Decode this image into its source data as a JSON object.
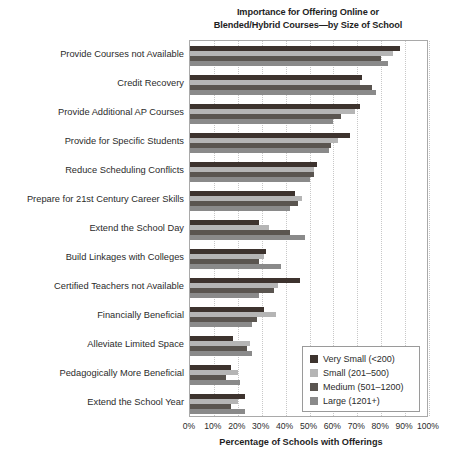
{
  "chart_data": {
    "type": "bar",
    "orientation": "horizontal",
    "title": "Importance for Offering Online or Blended/Hybrid Courses—by Size of School",
    "title_line1": "Importance for Offering Online or",
    "title_line2": "Blended/Hybrid Courses—by Size of School",
    "xlabel": "Percentage of Schools with Offerings",
    "ylabel": "",
    "xlim": [
      0,
      100
    ],
    "xtick_labels": [
      "0%",
      "10%",
      "20%",
      "30%",
      "40%",
      "50%",
      "60%",
      "70%",
      "80%",
      "90%",
      "100%"
    ],
    "xtick_values": [
      0,
      10,
      20,
      30,
      40,
      50,
      60,
      70,
      80,
      90,
      100
    ],
    "grid": true,
    "grid_axis": "x",
    "legend_position": "lower right",
    "categories": [
      "Provide Courses not Available",
      "Credit Recovery",
      "Provide Additional AP Courses",
      "Provide for Specific Students",
      "Reduce Scheduling Conflicts",
      "Prepare for 21st Century Career Skills",
      "Extend the School Day",
      "Build Linkages with Colleges",
      "Certified Teachers not Available",
      "Financially Beneficial",
      "Alleviate Limited Space",
      "Pedagogically More Beneficial",
      "Extend the School Year"
    ],
    "series": [
      {
        "name": "Very Small (<200)",
        "color": "#3d332e",
        "values": [
          88,
          72,
          71,
          67,
          53,
          44,
          29,
          32,
          46,
          31,
          18,
          17,
          23
        ]
      },
      {
        "name": "Small (201–500)",
        "color": "#b5b5b5",
        "values": [
          85,
          71,
          69,
          62,
          52,
          47,
          33,
          31,
          37,
          36,
          25,
          20,
          20
        ]
      },
      {
        "name": "Medium (501–1200)",
        "color": "#5a5550",
        "values": [
          80,
          76,
          63,
          59,
          52,
          45,
          42,
          29,
          35,
          28,
          24,
          15,
          17
        ]
      },
      {
        "name": "Large (1201+)",
        "color": "#8a8a8a",
        "values": [
          83,
          78,
          60,
          58,
          50,
          42,
          48,
          38,
          29,
          26,
          26,
          21,
          23
        ]
      }
    ]
  },
  "legend": {
    "items": [
      {
        "label": "Very Small (<200)",
        "color": "#3d332e"
      },
      {
        "label": "Small (201–500)",
        "color": "#b5b5b5"
      },
      {
        "label": "Medium (501–1200)",
        "color": "#5a5550"
      },
      {
        "label": "Large (1201+)",
        "color": "#8a8a8a"
      }
    ]
  }
}
